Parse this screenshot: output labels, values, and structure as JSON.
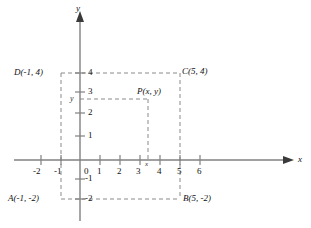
{
  "figure": {
    "type": "coordinate-plane-diagram",
    "axes": {
      "x_label": "x",
      "y_label": "y",
      "x_ticks": [
        "-2",
        "-1",
        "0",
        "1",
        "2",
        "3",
        "4",
        "5",
        "6"
      ],
      "x_tick_values": [
        -2,
        -1,
        0,
        1,
        2,
        3,
        4,
        5,
        6
      ],
      "y_ticks": [
        "4",
        "3",
        "2",
        "1",
        "0",
        "-1",
        "-2"
      ],
      "y_tick_values": [
        4,
        3,
        2,
        1,
        0,
        -1,
        -2
      ],
      "origin_label": "0",
      "xlim": [
        -2.8,
        7.2
      ],
      "ylim": [
        -2.9,
        5.2
      ]
    },
    "points": [
      {
        "id": "A",
        "label": "A(-1, -2)",
        "x": -1,
        "y": -2,
        "label_pos": "left-below"
      },
      {
        "id": "B",
        "label": "B(5, -2)",
        "x": 5,
        "y": -2,
        "label_pos": "right-below"
      },
      {
        "id": "C",
        "label": "C(5, 4)",
        "x": 5,
        "y": 4,
        "label_pos": "right-above"
      },
      {
        "id": "D",
        "label": "D(-1, 4)",
        "x": -1,
        "y": 4,
        "label_pos": "left-above"
      },
      {
        "id": "P",
        "label": "P(x, y)",
        "x": 3.4,
        "y": 3.1,
        "label_pos": "above-left"
      }
    ],
    "variable_marks": {
      "x_on_axis": "x",
      "y_on_axis": "y"
    },
    "colors": {
      "axis": "#808080",
      "dashed": "#8a8a8a",
      "text": "#111111"
    }
  }
}
